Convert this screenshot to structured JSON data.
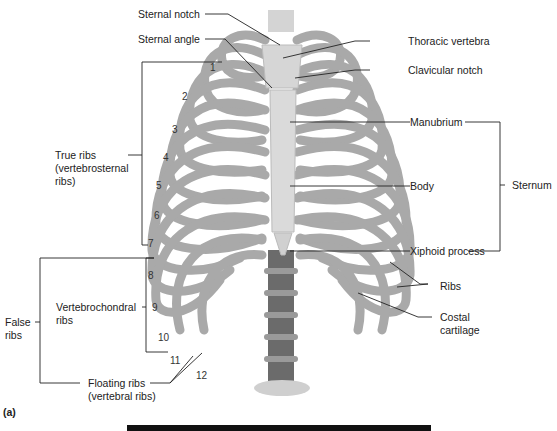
{
  "figure": {
    "panel_label": "(a)",
    "labels": {
      "sternal_notch": "Sternal notch",
      "sternal_angle": "Sternal angle",
      "thoracic_vertebra": "Thoracic vertebra",
      "clavicular_notch": "Clavicular notch",
      "manubrium": "Manubrium",
      "body": "Body",
      "sternum": "Sternum",
      "xiphoid_process": "Xiphoid process",
      "ribs": "Ribs",
      "costal_cartilage_1": "Costal",
      "costal_cartilage_2": "cartilage",
      "true_ribs_1": "True ribs",
      "true_ribs_2": "(vertebrosternal",
      "true_ribs_3": "ribs)",
      "false_ribs_1": "False",
      "false_ribs_2": "ribs",
      "vertebrochondral_1": "Vertebrochondral",
      "vertebrochondral_2": "ribs",
      "floating_1": "Floating ribs",
      "floating_2": "(vertebral ribs)"
    },
    "rib_numbers": [
      "1",
      "2",
      "3",
      "4",
      "5",
      "6",
      "7",
      "8",
      "9",
      "10",
      "11",
      "12"
    ]
  }
}
